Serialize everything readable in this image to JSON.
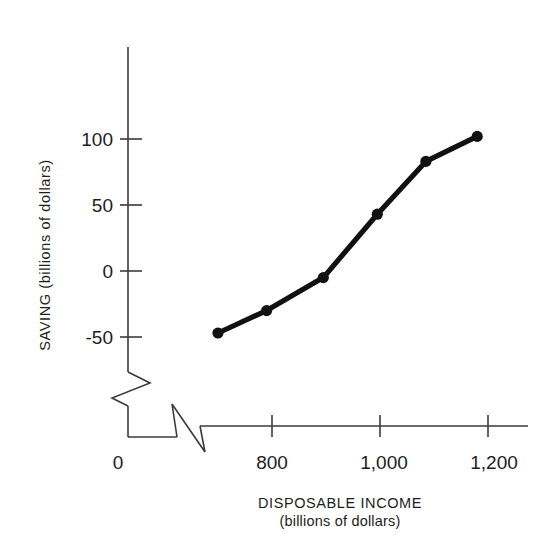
{
  "chart_data": {
    "type": "line",
    "title": "",
    "xlabel": "DISPOSABLE INCOME",
    "xlabel_sub": "(billions of dollars)",
    "ylabel": "SAVING (billions of dollars)",
    "x": [
      700,
      790,
      895,
      995,
      1085,
      1180
    ],
    "values": [
      -47,
      -30,
      -5,
      43,
      83,
      102
    ],
    "series": [
      {
        "name": "Saving",
        "points": [
          {
            "x": 700,
            "y": -47
          },
          {
            "x": 790,
            "y": -30
          },
          {
            "x": 895,
            "y": -5
          },
          {
            "x": 995,
            "y": 43
          },
          {
            "x": 1085,
            "y": 83
          },
          {
            "x": 1180,
            "y": 102
          }
        ]
      }
    ],
    "xticks": [
      800,
      1000,
      1200
    ],
    "xtick_labels": [
      "800",
      "1,000",
      "1,200"
    ],
    "yticks": [
      -50,
      0,
      50,
      100
    ],
    "ytick_labels": [
      "-50",
      "0",
      "50",
      "100"
    ],
    "origin_label": "0",
    "xlim": [
      660,
      1240
    ],
    "ylim": [
      -70,
      130
    ],
    "grid": false,
    "legend": "none",
    "axis_break_x": true,
    "axis_break_y": true,
    "marker": "filled-circle",
    "line_color": "#111111",
    "axis_color": "#3a3a3a",
    "background": "#ffffff"
  },
  "labels": {
    "ytick_100": "100",
    "ytick_50": "50",
    "ytick_0": "0",
    "ytick_neg50": "-50",
    "xtick_800": "800",
    "xtick_1000": "1,000",
    "xtick_1200": "1,200",
    "origin": "0",
    "x_axis_title": "DISPOSABLE INCOME",
    "x_axis_subtitle": "(billions of dollars)",
    "y_axis_title": "SAVING (billions of dollars)"
  }
}
